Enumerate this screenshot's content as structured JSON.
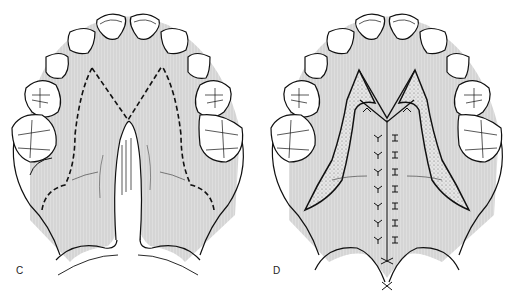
{
  "figure": {
    "panels": [
      {
        "id": "C",
        "label": "C",
        "description": "Palate with cleft; dashed incision lines outlining mucoperiosteal flaps"
      },
      {
        "id": "D",
        "label": "D",
        "description": "Palate after V-Y pushback closure; midline suture line with raw (stippled) lateral areas"
      }
    ],
    "colors": {
      "palate_fill": "#d9d9d9",
      "stroke": "#111111",
      "tooth_fill": "#ffffff",
      "raw_area": "#cfcfcf",
      "background": "#ffffff"
    }
  }
}
